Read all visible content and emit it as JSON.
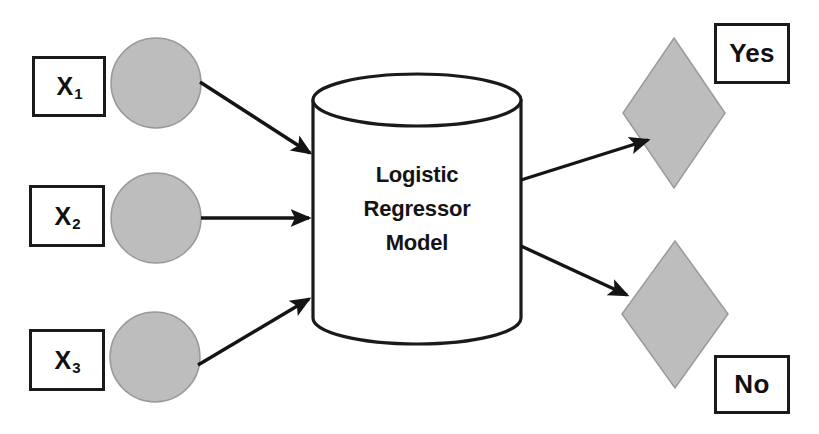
{
  "diagram": {
    "colors": {
      "shape_fill_gray": "#bdbdbd",
      "shape_stroke": "#8f8f8f",
      "outline_black": "#1a1a1a",
      "background": "#ffffff"
    },
    "inputs": [
      {
        "label": "X",
        "subscript": "1",
        "node_name": "input-node-1"
      },
      {
        "label": "X",
        "subscript": "2",
        "node_name": "input-node-2"
      },
      {
        "label": "X",
        "subscript": "3",
        "node_name": "input-node-3"
      }
    ],
    "model": {
      "line1": "Logistic",
      "line2": "Regressor",
      "line3": "Model"
    },
    "outputs": [
      {
        "label": "Yes",
        "node_name": "outcome-node-yes"
      },
      {
        "label": "No",
        "node_name": "outcome-node-no"
      }
    ],
    "arrows": [
      {
        "name": "arrow-input-1-to-model"
      },
      {
        "name": "arrow-input-2-to-model"
      },
      {
        "name": "arrow-input-3-to-model"
      },
      {
        "name": "arrow-model-to-yes"
      },
      {
        "name": "arrow-model-to-no"
      }
    ]
  }
}
